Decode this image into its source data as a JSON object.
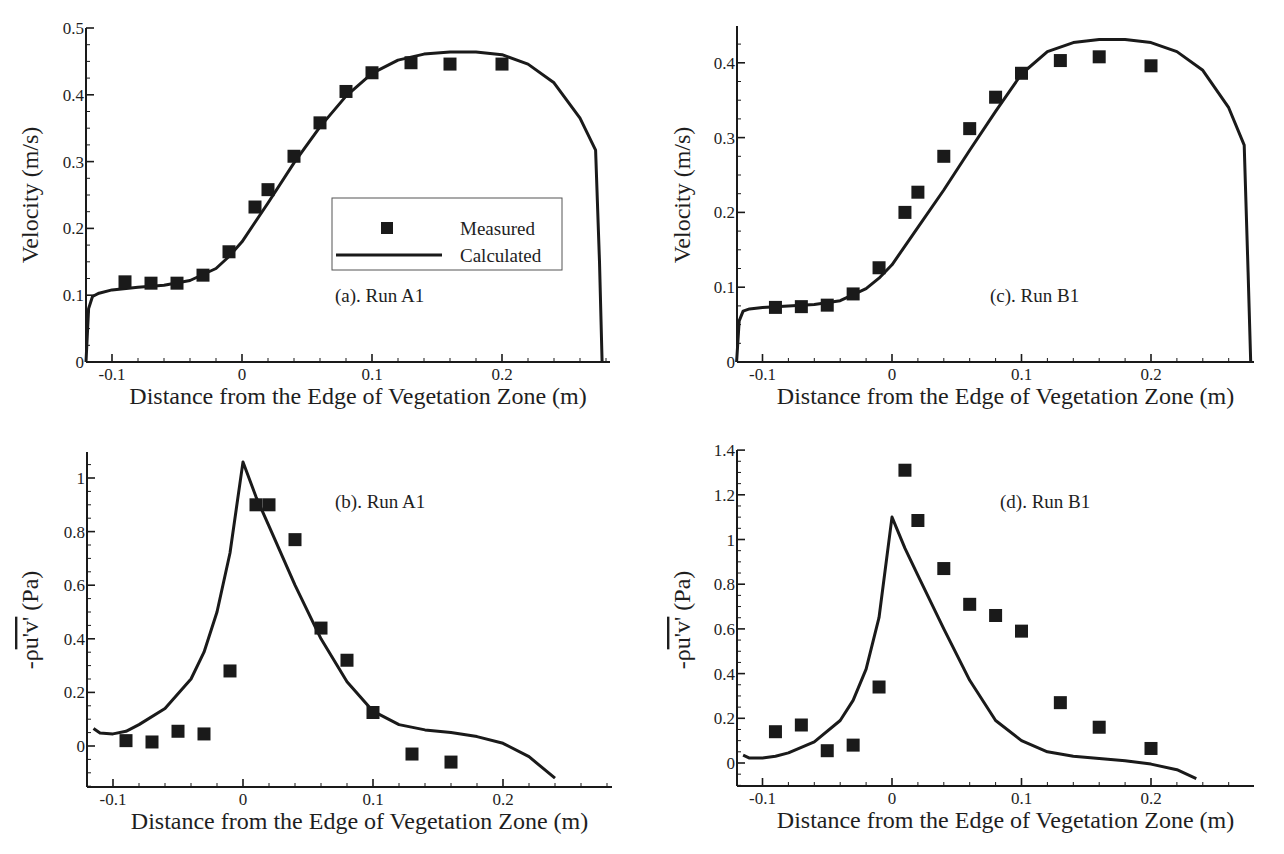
{
  "figure": {
    "xlabel": "Distance from the Edge of Vegetation Zone (m)",
    "legend": {
      "measured": "Measured",
      "calculated": "Calculated"
    }
  },
  "chart_data": [
    {
      "id": "a",
      "type": "scatter+line",
      "title": "(a). Run A1",
      "xlabel": "Distance from the Edge of Vegetation Zone (m)",
      "ylabel": "Velocity (m/s)",
      "xlim": [
        -0.12,
        0.28
      ],
      "ylim": [
        0,
        0.5
      ],
      "xticks": [
        -0.1,
        0,
        0.1,
        0.2
      ],
      "xtick_labels": [
        "-0.1",
        "0",
        "0.1",
        "0.2"
      ],
      "yticks": [
        0,
        0.1,
        0.2,
        0.3,
        0.4,
        0.5
      ],
      "ytick_labels": [
        "0",
        "0.1",
        "0.2",
        "0.3",
        "0.4",
        "0.5"
      ],
      "grid": false,
      "legend_position": "center-right",
      "series": [
        {
          "name": "Measured",
          "style": "square-marker",
          "x": [
            -0.09,
            -0.07,
            -0.05,
            -0.03,
            -0.01,
            0.01,
            0.02,
            0.04,
            0.06,
            0.08,
            0.1,
            0.13,
            0.16,
            0.2
          ],
          "y": [
            0.12,
            0.118,
            0.118,
            0.13,
            0.165,
            0.232,
            0.258,
            0.308,
            0.358,
            0.405,
            0.433,
            0.448,
            0.446,
            0.446
          ]
        },
        {
          "name": "Calculated",
          "style": "line",
          "x": [
            -0.12,
            -0.118,
            -0.115,
            -0.11,
            -0.1,
            -0.08,
            -0.06,
            -0.04,
            -0.02,
            -0.01,
            0.0,
            0.02,
            0.04,
            0.06,
            0.08,
            0.1,
            0.12,
            0.14,
            0.16,
            0.18,
            0.2,
            0.22,
            0.24,
            0.26,
            0.272,
            0.275,
            0.277
          ],
          "y": [
            0.0,
            0.08,
            0.098,
            0.103,
            0.108,
            0.112,
            0.115,
            0.122,
            0.14,
            0.158,
            0.18,
            0.238,
            0.298,
            0.352,
            0.398,
            0.432,
            0.452,
            0.461,
            0.464,
            0.464,
            0.46,
            0.446,
            0.418,
            0.365,
            0.317,
            0.15,
            0.0
          ]
        }
      ]
    },
    {
      "id": "b",
      "type": "scatter+line",
      "title": "(b). Run A1",
      "xlabel": "Distance from the Edge of Vegetation Zone (m)",
      "ylabel": "-ρu'v' (Pa)",
      "xlim": [
        -0.12,
        0.28
      ],
      "ylim": [
        -0.15,
        1.1
      ],
      "xticks": [
        -0.1,
        0,
        0.1,
        0.2
      ],
      "xtick_labels": [
        "-0.1",
        "0",
        "0.1",
        "0.2"
      ],
      "yticks": [
        0,
        0.2,
        0.4,
        0.6,
        0.8,
        1
      ],
      "ytick_labels": [
        "0",
        "0.2",
        "0.4",
        "0.6",
        "0.8",
        "1"
      ],
      "grid": false,
      "series": [
        {
          "name": "Measured",
          "style": "square-marker",
          "x": [
            -0.09,
            -0.07,
            -0.05,
            -0.03,
            -0.01,
            0.01,
            0.02,
            0.04,
            0.06,
            0.08,
            0.1,
            0.13,
            0.16
          ],
          "y": [
            0.02,
            0.015,
            0.055,
            0.045,
            0.28,
            0.9,
            0.9,
            0.77,
            0.44,
            0.32,
            0.125,
            -0.03,
            -0.06
          ]
        },
        {
          "name": "Calculated",
          "style": "line",
          "x": [
            -0.115,
            -0.11,
            -0.1,
            -0.09,
            -0.08,
            -0.06,
            -0.04,
            -0.03,
            -0.02,
            -0.01,
            0.0,
            0.01,
            0.02,
            0.04,
            0.06,
            0.08,
            0.1,
            0.12,
            0.14,
            0.16,
            0.18,
            0.2,
            0.22,
            0.24
          ],
          "y": [
            0.065,
            0.048,
            0.045,
            0.055,
            0.08,
            0.14,
            0.25,
            0.35,
            0.5,
            0.72,
            1.06,
            0.93,
            0.82,
            0.6,
            0.4,
            0.24,
            0.13,
            0.08,
            0.06,
            0.05,
            0.035,
            0.01,
            -0.04,
            -0.12
          ]
        }
      ]
    },
    {
      "id": "c",
      "type": "scatter+line",
      "title": "(c). Run B1",
      "xlabel": "Distance from the Edge of Vegetation Zone (m)",
      "ylabel": "Velocity (m/s)",
      "xlim": [
        -0.12,
        0.28
      ],
      "ylim": [
        0,
        0.45
      ],
      "xticks": [
        -0.1,
        0,
        0.1,
        0.2
      ],
      "xtick_labels": [
        "-0.1",
        "0",
        "0.1",
        "0.2"
      ],
      "yticks": [
        0,
        0.1,
        0.2,
        0.3,
        0.4
      ],
      "ytick_labels": [
        "0",
        "0.1",
        "0.2",
        "0.3",
        "0.4"
      ],
      "grid": false,
      "series": [
        {
          "name": "Measured",
          "style": "square-marker",
          "x": [
            -0.09,
            -0.07,
            -0.05,
            -0.03,
            -0.01,
            0.01,
            0.02,
            0.04,
            0.06,
            0.08,
            0.1,
            0.13,
            0.16,
            0.2
          ],
          "y": [
            0.073,
            0.074,
            0.076,
            0.091,
            0.126,
            0.2,
            0.227,
            0.275,
            0.312,
            0.354,
            0.386,
            0.403,
            0.408,
            0.396
          ]
        },
        {
          "name": "Calculated",
          "style": "line",
          "x": [
            -0.12,
            -0.118,
            -0.115,
            -0.11,
            -0.1,
            -0.08,
            -0.06,
            -0.04,
            -0.02,
            -0.01,
            0.0,
            0.02,
            0.04,
            0.06,
            0.08,
            0.1,
            0.12,
            0.14,
            0.16,
            0.18,
            0.2,
            0.22,
            0.24,
            0.26,
            0.272,
            0.275,
            0.277
          ],
          "y": [
            0.0,
            0.055,
            0.068,
            0.071,
            0.073,
            0.075,
            0.077,
            0.082,
            0.098,
            0.112,
            0.13,
            0.18,
            0.23,
            0.283,
            0.335,
            0.385,
            0.415,
            0.427,
            0.431,
            0.431,
            0.427,
            0.415,
            0.39,
            0.34,
            0.29,
            0.12,
            0.0
          ]
        }
      ]
    },
    {
      "id": "d",
      "type": "scatter+line",
      "title": "(d). Run B1",
      "xlabel": "Distance from the Edge of Vegetation Zone (m)",
      "ylabel": "-ρu'v' (Pa)",
      "xlim": [
        -0.12,
        0.28
      ],
      "ylim": [
        -0.1,
        1.4
      ],
      "xticks": [
        -0.1,
        0,
        0.1,
        0.2
      ],
      "xtick_labels": [
        "-0.1",
        "0",
        "0.1",
        "0.2"
      ],
      "yticks": [
        0,
        0.2,
        0.4,
        0.6,
        0.8,
        1,
        1.2,
        1.4
      ],
      "ytick_labels": [
        "0",
        "0.2",
        "0.4",
        "0.6",
        "0.8",
        "1",
        "1.2",
        "1.4"
      ],
      "grid": false,
      "series": [
        {
          "name": "Measured",
          "style": "square-marker",
          "x": [
            -0.09,
            -0.07,
            -0.05,
            -0.03,
            -0.01,
            0.01,
            0.02,
            0.04,
            0.06,
            0.08,
            0.1,
            0.13,
            0.16,
            0.2
          ],
          "y": [
            0.14,
            0.17,
            0.055,
            0.08,
            0.34,
            1.31,
            1.085,
            0.87,
            0.71,
            0.66,
            0.59,
            0.27,
            0.16,
            0.065
          ]
        },
        {
          "name": "Calculated",
          "style": "line",
          "x": [
            -0.115,
            -0.11,
            -0.1,
            -0.09,
            -0.08,
            -0.06,
            -0.04,
            -0.03,
            -0.02,
            -0.01,
            0.0,
            0.01,
            0.02,
            0.04,
            0.06,
            0.08,
            0.1,
            0.12,
            0.14,
            0.16,
            0.18,
            0.2,
            0.22,
            0.235
          ],
          "y": [
            0.035,
            0.022,
            0.022,
            0.03,
            0.045,
            0.095,
            0.19,
            0.28,
            0.42,
            0.65,
            1.1,
            0.96,
            0.84,
            0.6,
            0.37,
            0.19,
            0.1,
            0.05,
            0.03,
            0.02,
            0.01,
            -0.005,
            -0.03,
            -0.07
          ]
        }
      ]
    }
  ],
  "panels_layout": [
    {
      "id": "a",
      "ox": 86,
      "oy": 362,
      "x0px": 242,
      "pxPerX": 1300,
      "y0px": 362,
      "pxPerY": 668,
      "yTop": 28,
      "xEnd": 610,
      "labelX": 335,
      "labelY": 302,
      "ylabelX": 38,
      "ylabelY": 195,
      "showLegend": true
    },
    {
      "id": "b",
      "ox": 87,
      "oy": 787,
      "x0px": 243,
      "pxPerX": 1300,
      "y0px": 746,
      "pxPerY": 268,
      "yTop": 452,
      "xEnd": 612,
      "labelX": 335,
      "labelY": 508,
      "ylabelX": 38,
      "ylabelY": 620,
      "showLegend": false
    },
    {
      "id": "c",
      "ox": 737,
      "oy": 362,
      "x0px": 892,
      "pxPerX": 1295,
      "y0px": 362,
      "pxPerY": 748,
      "yTop": 26,
      "xEnd": 1254,
      "labelX": 990,
      "labelY": 302,
      "ylabelX": 690,
      "ylabelY": 195,
      "showLegend": false
    },
    {
      "id": "d",
      "ox": 737,
      "oy": 786,
      "x0px": 892,
      "pxPerX": 1295,
      "y0px": 763,
      "pxPerY": 223.5,
      "yTop": 450,
      "xEnd": 1254,
      "labelX": 1000,
      "labelY": 508,
      "ylabelX": 690,
      "ylabelY": 620,
      "showLegend": false
    }
  ],
  "colors": {
    "ink": "#1a1a1a",
    "background": "#ffffff",
    "legend_border": "#555555"
  }
}
